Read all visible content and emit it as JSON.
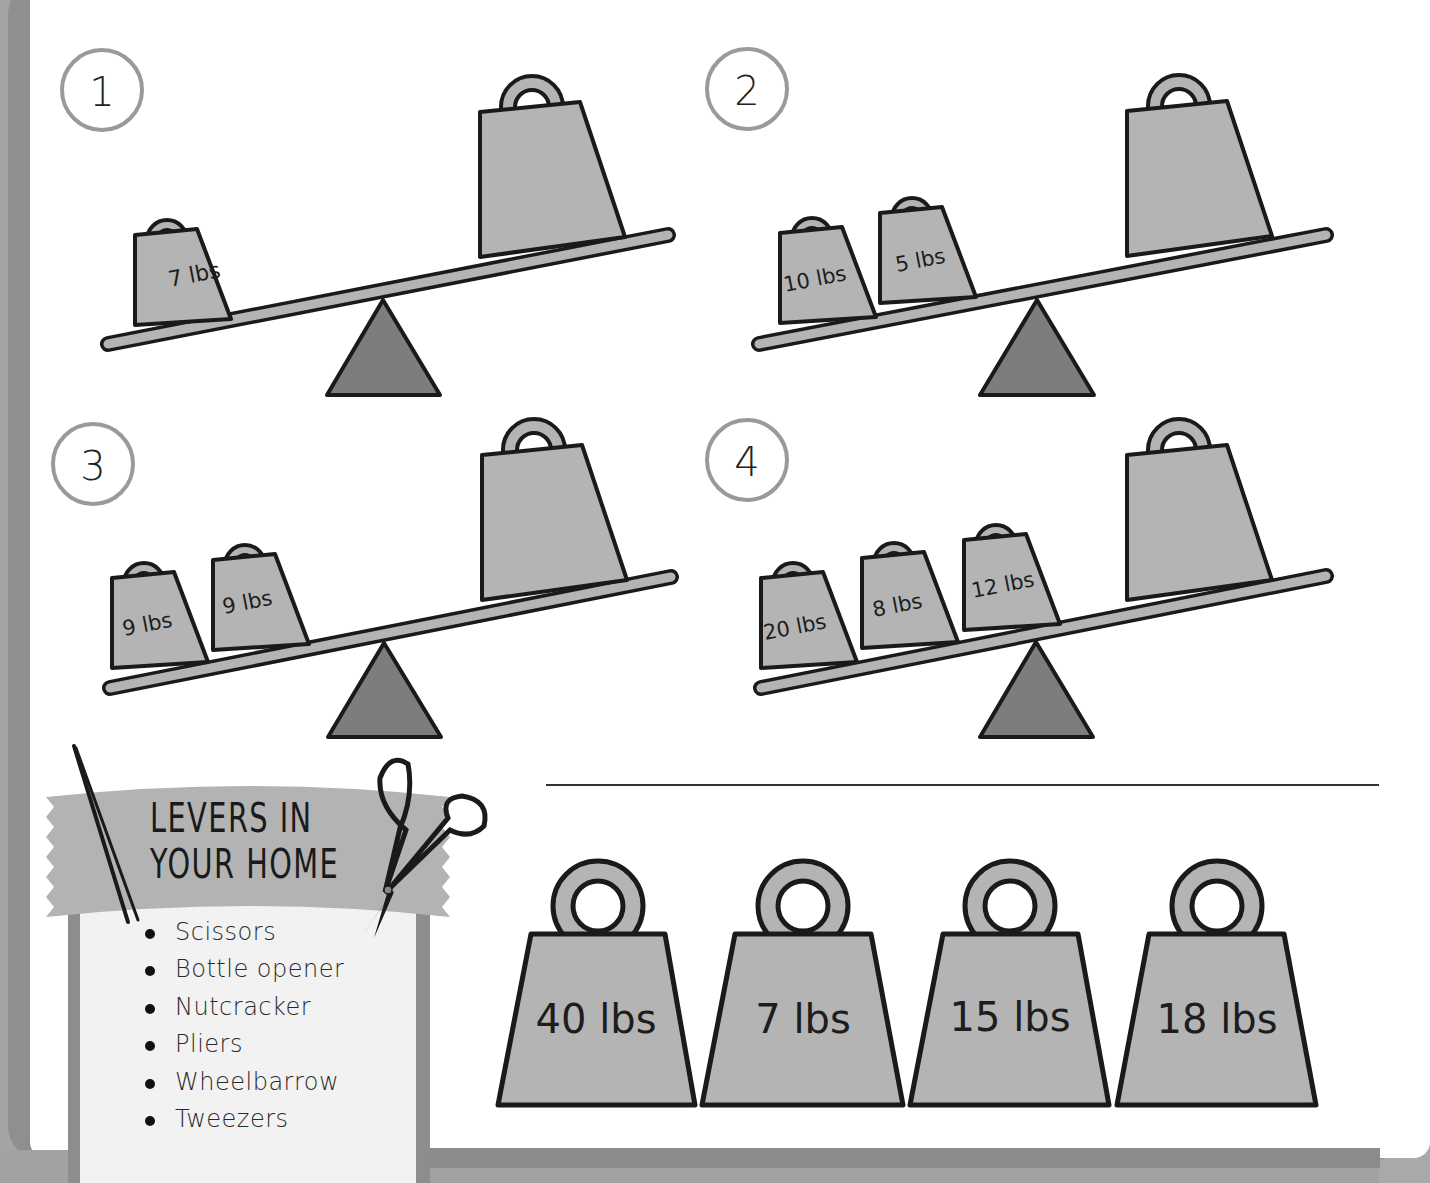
{
  "problems": [
    {
      "number": "1",
      "left_weights": [
        "7 lbs"
      ],
      "right_weight_label": ""
    },
    {
      "number": "2",
      "left_weights": [
        "10 lbs",
        "5 lbs"
      ],
      "right_weight_label": ""
    },
    {
      "number": "3",
      "left_weights": [
        "9 lbs",
        "9 lbs"
      ],
      "right_weight_label": ""
    },
    {
      "number": "4",
      "left_weights": [
        "20 lbs",
        "8 lbs",
        "12 lbs"
      ],
      "right_weight_label": ""
    }
  ],
  "answer_choices": [
    "40 lbs",
    "7 lbs",
    "15 lbs",
    "18 lbs"
  ],
  "levers_box": {
    "title_line1": "LEVERS IN",
    "title_line2": "YOUR HOME",
    "items": [
      "Scissors",
      "Bottle opener",
      "Nutcracker",
      "Pliers",
      "Wheelbarrow",
      "Tweezers"
    ]
  },
  "colors": {
    "weight_fill": "#b4b4b4",
    "fulcrum_fill": "#7d7d7d",
    "outline": "#1a1a1a",
    "frame": "#a4a4a4",
    "circle_stroke": "#9a9a9a"
  }
}
